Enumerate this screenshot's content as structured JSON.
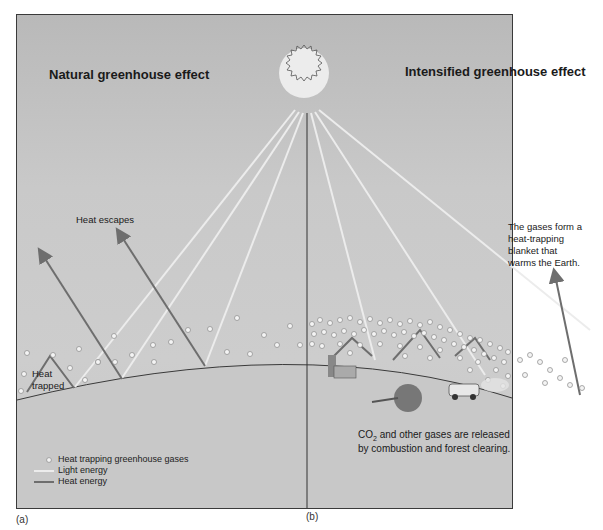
{
  "diagram": {
    "panel_a": {
      "title": "Natural greenhouse effect",
      "label_heat_escapes": "Heat escapes",
      "label_heat_trapped_1": "Heat",
      "label_heat_trapped_2": "trapped",
      "caption": "(a)"
    },
    "panel_b": {
      "title": "Intensified greenhouse effect",
      "blanket_note_1": "The gases form a",
      "blanket_note_2": "heat-trapping",
      "blanket_note_3": "blanket that",
      "blanket_note_4": "warms the Earth.",
      "co2_note_prefix": "CO",
      "co2_note_sub": "2",
      "co2_note_rest": " and other gases are released",
      "co2_note_line2": "by combustion and forest clearing.",
      "caption": "(b)"
    },
    "legend": {
      "gases": "Heat trapping greenhouse gases",
      "light": "Light energy",
      "heat": "Heat energy"
    },
    "colors": {
      "sky": "#c4c4c4",
      "ground": "#c9c9c9",
      "heat_arrow": "#6e6e6e",
      "light_ray": "#ececec",
      "border": "#3a3a3a"
    }
  }
}
